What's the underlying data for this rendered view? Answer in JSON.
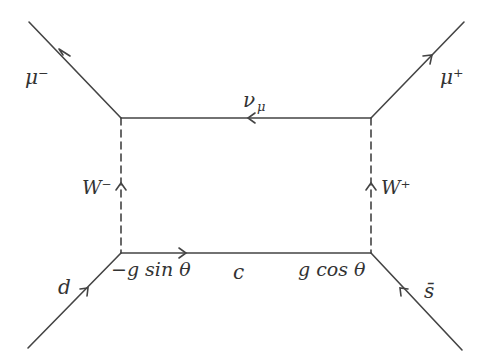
{
  "diagram": {
    "type": "feynman",
    "line_color": "#444444",
    "vertices": {
      "top_left": [
        121,
        118
      ],
      "top_right": [
        371,
        118
      ],
      "bottom_left": [
        121,
        253
      ],
      "bottom_right": [
        371,
        253
      ]
    },
    "external_lines": {
      "mu_minus": {
        "label": "μ⁻",
        "from": [
          121,
          118
        ],
        "to": [
          29,
          22
        ]
      },
      "mu_plus": {
        "label": "μ⁺",
        "from": [
          371,
          118
        ],
        "to": [
          464,
          22
        ]
      },
      "d": {
        "label": "d",
        "from": [
          28,
          348
        ],
        "to": [
          121,
          253
        ]
      },
      "s_bar": {
        "label": "s̄",
        "from": [
          462,
          350
        ],
        "to": [
          371,
          253
        ]
      }
    },
    "internal_lines": {
      "nu_mu": {
        "label_main": "ν",
        "label_sub": "μ",
        "style": "solid"
      },
      "c": {
        "label": "c",
        "style": "solid"
      },
      "w_minus": {
        "label": "W⁻",
        "style": "dashed"
      },
      "w_plus": {
        "label": "W⁺",
        "style": "dashed"
      }
    },
    "couplings": {
      "bottom_left": "−g sin θ",
      "bottom_right": "g cos θ"
    }
  }
}
